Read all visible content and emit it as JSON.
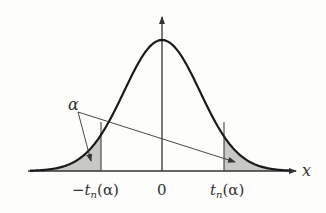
{
  "diagram": {
    "axis_x_label": "x",
    "tick_center": "0",
    "tick_left": "−t",
    "tick_left_sub": "n",
    "tick_left_arg": "(α)",
    "tick_right": "t",
    "tick_right_sub": "n",
    "tick_right_arg": "(α)",
    "tail_label": "α",
    "colors": {
      "curve": "#1a1a1a",
      "axis": "#333333",
      "shade": "#c8c8c4",
      "text": "#333333"
    }
  }
}
